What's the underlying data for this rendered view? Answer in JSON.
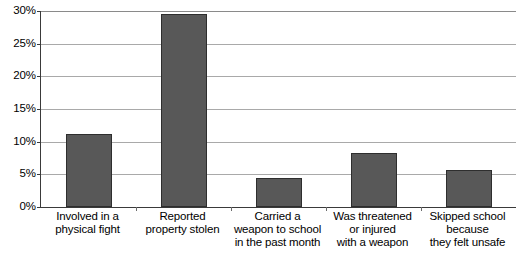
{
  "chart_data": {
    "type": "bar",
    "title": "",
    "subtitle": "",
    "xlabel": "",
    "ylabel": "",
    "ylim": [
      0,
      30
    ],
    "grid": true,
    "legend": false,
    "legend_position": "none",
    "y_tick_labels": [
      "30%",
      "25%",
      "20%",
      "15%",
      "10%",
      "5%",
      "0%"
    ],
    "y_tick_values": [
      30,
      25,
      20,
      15,
      10,
      5,
      0
    ],
    "categories": [
      "Involved in a physical fight",
      "Reported property stolen",
      "Carried a weapon to school in the past month",
      "Was threatened or injured with a weapon",
      "Skipped school because they felt unsafe"
    ],
    "category_lines": [
      [
        "Involved in a",
        "physical fight"
      ],
      [
        "Reported",
        "property stolen"
      ],
      [
        "Carried a",
        "weapon to school",
        "in the past month"
      ],
      [
        "Was threatened",
        "or injured",
        "with a weapon"
      ],
      [
        "Skipped school",
        "because",
        "they felt unsafe"
      ]
    ],
    "values": [
      11.2,
      29.5,
      4.5,
      8.3,
      5.6
    ],
    "value_labels": [
      "11.2%",
      "29.5%",
      "4.5%",
      "8.3%",
      "5.6%"
    ],
    "colors": {
      "bar_fill": "#585858",
      "bar_border": "#2e2e2e",
      "gridline": "#a9a9a9",
      "axis": "#3a3a3a",
      "background": "#ffffff",
      "text": "#000000"
    }
  }
}
